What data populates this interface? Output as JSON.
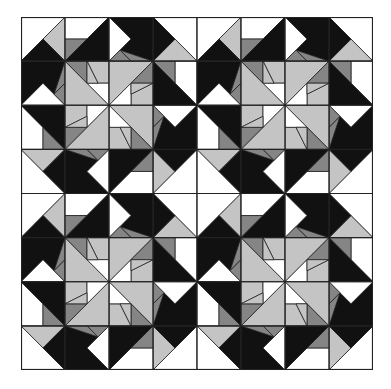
{
  "figure": {
    "block_size": 176,
    "cell_size": 44,
    "grid": {
      "block_rows": 2,
      "block_cols": 2,
      "cells_per_block": 4
    },
    "colors": {
      "W": "#ffffff",
      "L": "#c4c4c4",
      "M": "#858585",
      "B": "#111111"
    },
    "quarter": [
      {
        "c": "W",
        "p": "0,0 44,0 0,44"
      },
      {
        "c": "L",
        "p": "44,0 44,44 22,22"
      },
      {
        "c": "B",
        "p": "22,22 44,44 0,44"
      },
      {
        "c": "W",
        "p": "44,0 88,0 66,22 44,22"
      },
      {
        "c": "M",
        "p": "44,22 66,22 44,44"
      },
      {
        "c": "B",
        "p": "88,0 88,44 44,44 66,22"
      },
      {
        "c": "B",
        "p": "0,44 44,44 44,66 22,88 0,88"
      },
      {
        "c": "M",
        "p": "44,44 44,66 33,77"
      },
      {
        "c": "W",
        "p": "0,88 22,66 44,88"
      },
      {
        "c": "M",
        "p": "44,88 44,66 33,77"
      },
      {
        "c": "L",
        "p": "44,44 88,88 44,88"
      },
      {
        "c": "M",
        "p": "44,44 66,44 66,66"
      },
      {
        "c": "L",
        "p": "66,44 88,44 88,66 77,66"
      },
      {
        "c": "W",
        "p": "66,66 77,66 88,66 88,88"
      },
      {
        "c": "L",
        "p": "66,44 66,66 77,66"
      }
    ],
    "rotations_deg": [
      0,
      90,
      180,
      270
    ]
  }
}
